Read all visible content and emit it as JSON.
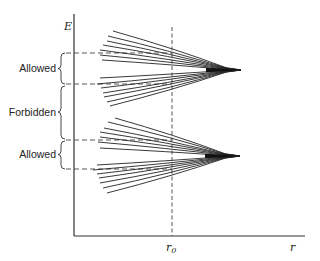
{
  "diagram": {
    "axes": {
      "y_label": "E",
      "x_label": "r",
      "x_tick_label_main": "r",
      "x_tick_label_sub": "0"
    },
    "bands": [
      {
        "label": "Allowed",
        "y_top": 53,
        "y_bottom": 84
      },
      {
        "label": "Forbidden",
        "y_top": 85,
        "y_bottom": 139
      },
      {
        "label": "Allowed",
        "y_top": 140,
        "y_bottom": 169
      }
    ],
    "fans": [
      {
        "name": "upper-level",
        "tip": [
          241,
          70
        ],
        "converge": [
          226,
          70
        ],
        "left_ends": [
          [
            113,
            31
          ],
          [
            108,
            36
          ],
          [
            107,
            41
          ],
          [
            103,
            45
          ],
          [
            100,
            50
          ],
          [
            100,
            55
          ],
          [
            102,
            60
          ],
          [
            100,
            78
          ],
          [
            97,
            84
          ],
          [
            101,
            88
          ],
          [
            103,
            93
          ],
          [
            104,
            97
          ],
          [
            107,
            102
          ],
          [
            110,
            106
          ]
        ]
      },
      {
        "name": "lower-level",
        "tip": [
          240,
          156
        ],
        "converge": [
          225,
          156
        ],
        "left_ends": [
          [
            115,
            118
          ],
          [
            108,
            122
          ],
          [
            104,
            128
          ],
          [
            100,
            132
          ],
          [
            100,
            137
          ],
          [
            98,
            142
          ],
          [
            100,
            148
          ],
          [
            97,
            165
          ],
          [
            93,
            170
          ],
          [
            97,
            174
          ],
          [
            99,
            178
          ],
          [
            100,
            183
          ],
          [
            103,
            188
          ],
          [
            107,
            193
          ]
        ]
      }
    ],
    "colors": {
      "line": "#222222",
      "dash": "#444444",
      "background": "#ffffff"
    }
  }
}
